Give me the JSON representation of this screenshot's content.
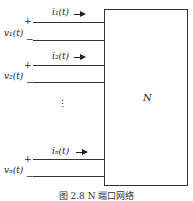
{
  "network": {
    "block_label": "N"
  },
  "ports": [
    {
      "current": "i₁(t)",
      "voltage": "v₁(t)",
      "plus": "+",
      "minus": "−"
    },
    {
      "current": "i₂(t)",
      "voltage": "v₂(t)",
      "plus": "+",
      "minus": "−"
    },
    {
      "current": "iₙ(t)",
      "voltage": "vₙ(t)",
      "plus": "+",
      "minus": "−"
    }
  ],
  "ellipsis": "⋮",
  "caption": "图 2.8   N 端口网络"
}
